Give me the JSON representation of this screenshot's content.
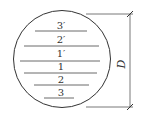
{
  "diagram": {
    "layers": [
      {
        "label": "3′"
      },
      {
        "label": "2′"
      },
      {
        "label": "1′"
      },
      {
        "label": "1"
      },
      {
        "label": "2"
      },
      {
        "label": "3"
      }
    ],
    "dimension_label": "D"
  }
}
